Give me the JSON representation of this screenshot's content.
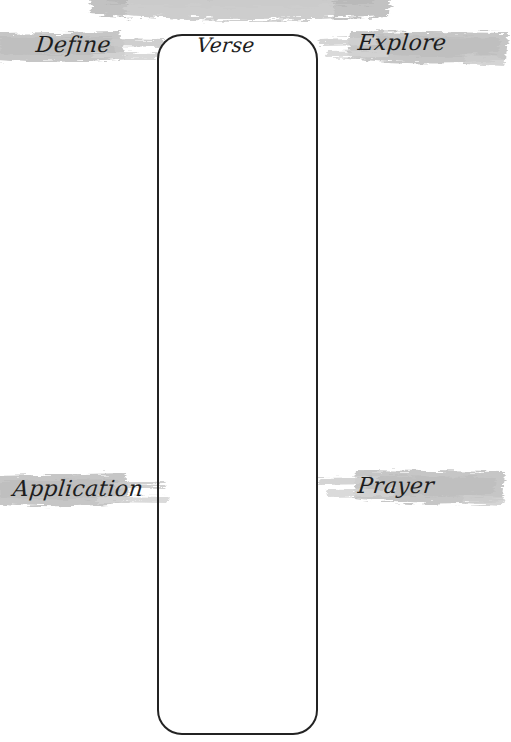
{
  "page": {
    "background_color": "#ffffff",
    "width": 505,
    "height": 742
  },
  "theme": {
    "ink_color": "#1d1d1d",
    "box_stroke_color": "#232323",
    "brush_color": "#c6c6c6",
    "brush_color_light": "#d8d8d8",
    "brush_color_dark": "#b4b4b4"
  },
  "top_banner": {
    "name": "cropped-title-brush-stroke",
    "visible_text": "",
    "note": "brush stroke cropped by the top edge of the page"
  },
  "verse_box": {
    "label": "Verse",
    "placeholder": "",
    "value": "",
    "x": 157,
    "y": 34,
    "width": 161,
    "height": 701,
    "corner_radius": 25
  },
  "sections": [
    {
      "id": "define",
      "label": "Define",
      "side": "left",
      "row": "top",
      "value": "",
      "placeholder": ""
    },
    {
      "id": "explore",
      "label": "Explore",
      "side": "right",
      "row": "top",
      "value": "",
      "placeholder": ""
    },
    {
      "id": "application",
      "label": "Application",
      "side": "left",
      "row": "bottom",
      "value": "",
      "placeholder": ""
    },
    {
      "id": "prayer",
      "label": "Prayer",
      "side": "right",
      "row": "bottom",
      "value": "",
      "placeholder": ""
    }
  ]
}
